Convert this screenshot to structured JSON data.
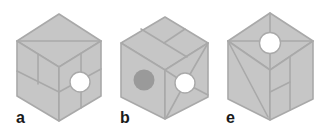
{
  "figure": {
    "colors": {
      "face": "#c6c6c6",
      "edge": "#a9a9a9",
      "hole": "#ffffff",
      "dot": "#9a9a9a",
      "label": "#1a1a1a"
    },
    "cubes": [
      {
        "label": "a",
        "features": [
          "top face diagonal",
          "left face brick lines",
          "right face white circle with cross lines"
        ]
      },
      {
        "label": "b",
        "features": [
          "top face T-split lines",
          "left face dark grey circle",
          "right face white circle with radiating lines"
        ]
      },
      {
        "label": "e",
        "features": [
          "top face white circle with radiating lines",
          "left face diagonal",
          "right face vertical and cross line"
        ]
      }
    ]
  }
}
